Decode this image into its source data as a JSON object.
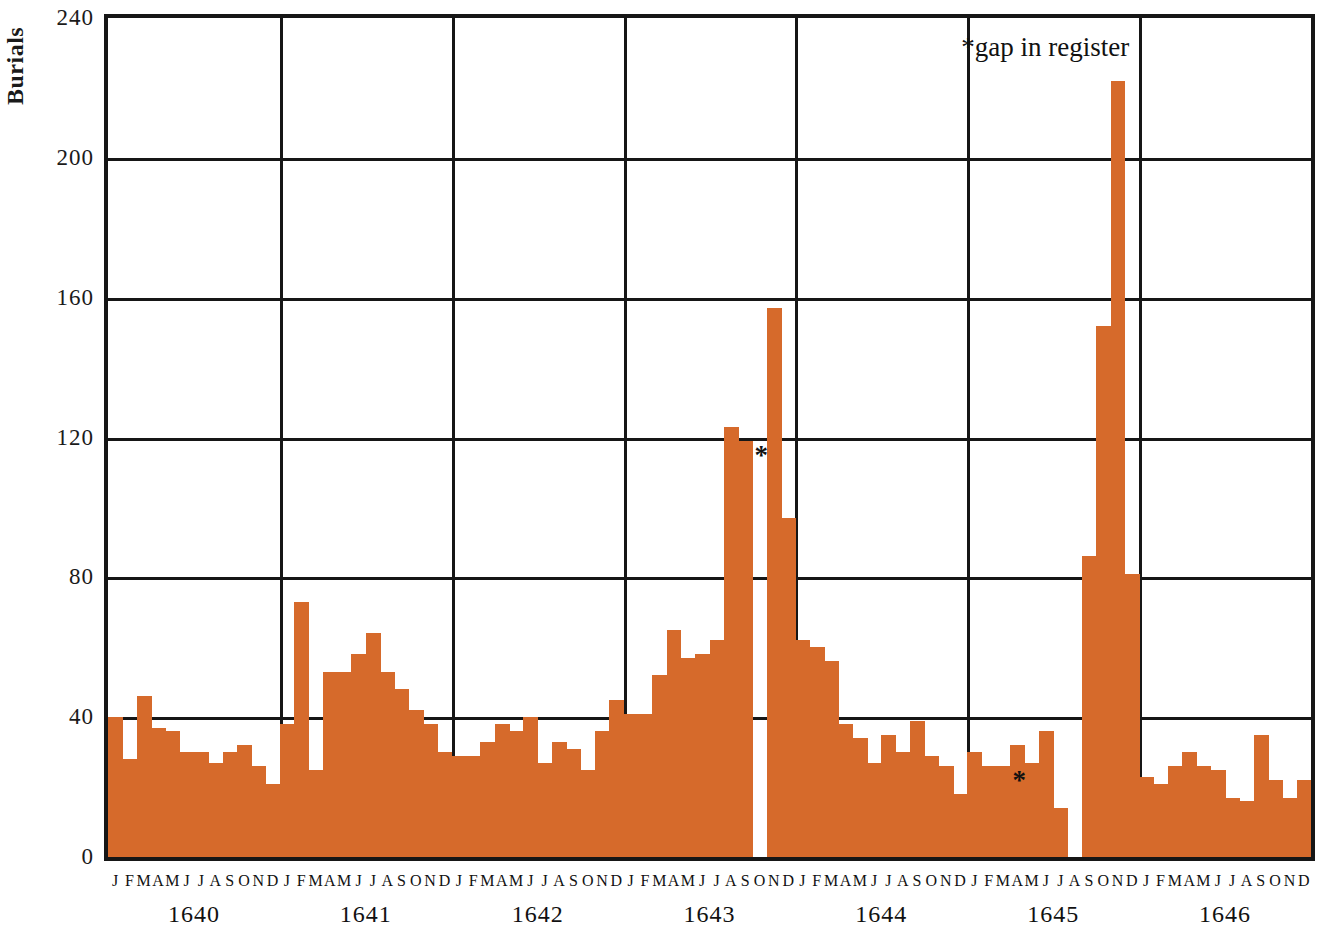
{
  "chart_data": {
    "type": "bar",
    "title": "",
    "xlabel": "",
    "ylabel": "Burials",
    "ylim": [
      0,
      240
    ],
    "yticks": [
      0,
      40,
      80,
      120,
      160,
      200,
      240
    ],
    "ytick_labels": [
      "0",
      "40",
      "80",
      "120",
      "160",
      "200",
      "240"
    ],
    "grid": true,
    "legend": null,
    "annotation": "*gap in register",
    "bar_color": "#d66a2b",
    "axis_color": "#161616",
    "month_labels": [
      "J",
      "F",
      "M",
      "A",
      "M",
      "J",
      "J",
      "A",
      "S",
      "O",
      "N",
      "D"
    ],
    "years": [
      "1640",
      "1641",
      "1642",
      "1643",
      "1644",
      "1645",
      "1646"
    ],
    "categories": [
      "1640-J",
      "1640-F",
      "1640-M",
      "1640-A",
      "1640-M",
      "1640-J",
      "1640-J",
      "1640-A",
      "1640-S",
      "1640-O",
      "1640-N",
      "1640-D",
      "1641-J",
      "1641-F",
      "1641-M",
      "1641-A",
      "1641-M",
      "1641-J",
      "1641-J",
      "1641-A",
      "1641-S",
      "1641-O",
      "1641-N",
      "1641-D",
      "1642-J",
      "1642-F",
      "1642-M",
      "1642-A",
      "1642-M",
      "1642-J",
      "1642-J",
      "1642-A",
      "1642-S",
      "1642-O",
      "1642-N",
      "1642-D",
      "1643-J",
      "1643-F",
      "1643-M",
      "1643-A",
      "1643-M",
      "1643-J",
      "1643-J",
      "1643-A",
      "1643-S",
      "1643-O",
      "1643-N",
      "1643-D",
      "1644-J",
      "1644-F",
      "1644-M",
      "1644-A",
      "1644-M",
      "1644-J",
      "1644-J",
      "1644-A",
      "1644-S",
      "1644-O",
      "1644-N",
      "1644-D",
      "1645-J",
      "1645-F",
      "1645-M",
      "1645-A",
      "1645-M",
      "1645-J",
      "1645-J",
      "1645-A",
      "1645-S",
      "1645-O",
      "1645-N",
      "1645-D",
      "1646-J",
      "1646-F",
      "1646-M",
      "1646-A",
      "1646-M",
      "1646-J",
      "1646-J",
      "1646-A",
      "1646-S",
      "1646-O",
      "1646-N",
      "1646-D"
    ],
    "values": [
      40,
      28,
      46,
      37,
      36,
      30,
      30,
      27,
      30,
      32,
      26,
      21,
      38,
      73,
      25,
      53,
      53,
      58,
      64,
      53,
      48,
      42,
      38,
      30,
      29,
      29,
      33,
      38,
      36,
      40,
      27,
      33,
      31,
      25,
      36,
      45,
      41,
      41,
      52,
      65,
      57,
      58,
      62,
      123,
      119,
      null,
      157,
      97,
      62,
      60,
      56,
      38,
      34,
      27,
      35,
      30,
      39,
      29,
      26,
      18,
      30,
      26,
      26,
      32,
      27,
      36,
      14,
      null,
      86,
      152,
      222,
      81,
      23,
      21,
      26,
      30,
      26,
      25,
      17,
      16,
      35,
      22,
      17,
      22
    ],
    "gap_months": [
      "1643-O",
      "1645-A"
    ],
    "gap_marker": "*"
  }
}
